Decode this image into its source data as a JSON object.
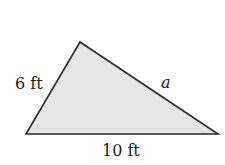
{
  "diagram": {
    "shape": "triangle",
    "fill_color": "#e6e6e6",
    "stroke_color": "#2a2a2a",
    "vertices": {
      "top": [
        80,
        42
      ],
      "bottom_left": [
        26,
        134
      ],
      "bottom_right": [
        218,
        134
      ]
    },
    "labels": {
      "left_side": "6 ft",
      "right_side": "a",
      "base": "10 ft"
    }
  }
}
